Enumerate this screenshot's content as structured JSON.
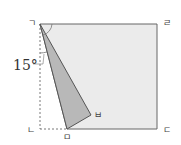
{
  "diagram": {
    "type": "geometry-folded-rectangle",
    "vertices": {
      "top_left": "ㄱ",
      "top_right": "ㄹ",
      "bottom_right": "ㄷ",
      "bottom_left": "ㄴ",
      "fold_bottom": "ㅁ",
      "fold_point": "ㅂ"
    },
    "angle_label": "15°",
    "angle_marker": "ㄱ",
    "colors": {
      "rect_fill": "#ebebeb",
      "triangle_fill": "#b8b8b8",
      "stroke": "#555555"
    }
  }
}
